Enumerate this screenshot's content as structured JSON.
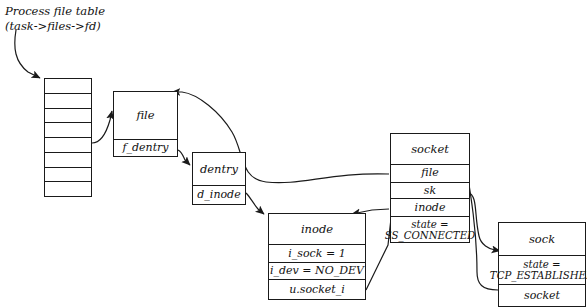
{
  "diagram": {
    "title": "Process file table\n(task->files->fd)",
    "caption_line1": "Process file table",
    "caption_line2": "(task->files->fd)",
    "file_table": {
      "name": "process-file-table",
      "cell_count": 8,
      "cells": [
        "",
        "",
        "",
        "",
        "",
        "",
        "",
        ""
      ]
    },
    "structs": [
      {
        "id": "file",
        "header": "file",
        "fields": [
          "f_dentry"
        ]
      },
      {
        "id": "dentry",
        "header": "dentry",
        "fields": [
          "d_inode"
        ]
      },
      {
        "id": "inode",
        "header": "inode",
        "fields": [
          "i_sock = 1",
          "i_dev = NO_DEV",
          "u.socket_i"
        ]
      },
      {
        "id": "socket",
        "header": "socket",
        "fields": [
          "file",
          "sk",
          "inode",
          "state =\nSS_CONNECTED"
        ]
      },
      {
        "id": "sock",
        "header": "sock",
        "fields": [
          "state =\nTCP_ESTABLISHED",
          "socket"
        ]
      }
    ],
    "colors": {
      "ink": "#1a1a1a",
      "paper": "#ffffff"
    }
  }
}
